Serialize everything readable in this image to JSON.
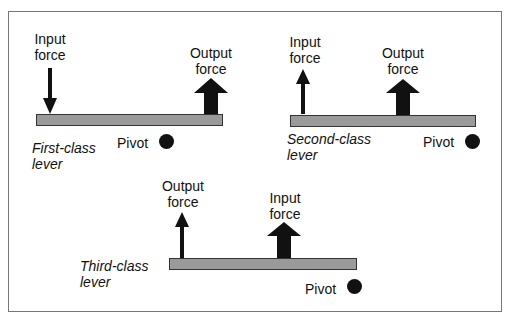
{
  "diagram": {
    "levers": [
      {
        "name_line1": "First-class",
        "name_line2": "lever",
        "input_line1": "Input",
        "input_line2": "force",
        "output_line1": "Output",
        "output_line2": "force",
        "pivot": "Pivot",
        "input_direction": "down",
        "output_direction": "up"
      },
      {
        "name_line1": "Second-class",
        "name_line2": "lever",
        "input_line1": "Input",
        "input_line2": "force",
        "output_line1": "Output",
        "output_line2": "force",
        "pivot": "Pivot",
        "input_direction": "up",
        "output_direction": "up"
      },
      {
        "name_line1": "Third-class",
        "name_line2": "lever",
        "input_line1": "Input",
        "input_line2": "force",
        "output_line1": "Output",
        "output_line2": "force",
        "pivot": "Pivot",
        "input_direction": "up",
        "output_direction": "up"
      }
    ],
    "colors": {
      "bar": "#9a9a9a",
      "arrow": "#111111",
      "border": "#777777"
    }
  }
}
